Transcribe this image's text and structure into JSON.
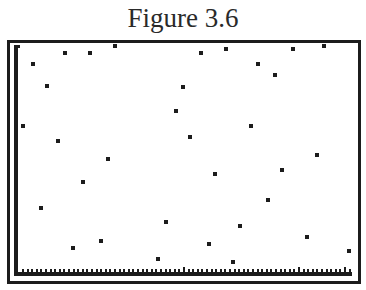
{
  "title": "Figure 3.6",
  "chart_data": {
    "type": "scatter",
    "title": "Figure 3.6",
    "xlabel": "",
    "ylabel": "",
    "grid": false,
    "legend": null,
    "x_axis_ticks": "many evenly spaced tick marks along bottom axis, unlabeled",
    "note": "Calculator-style scatter plot; pixel coordinates of points (x right, y down)",
    "points_px": [
      [
        33,
        64
      ],
      [
        47,
        86
      ],
      [
        65,
        53
      ],
      [
        90,
        53
      ],
      [
        115,
        46
      ],
      [
        201,
        53
      ],
      [
        226,
        49
      ],
      [
        258,
        64
      ],
      [
        275,
        75
      ],
      [
        293,
        49
      ],
      [
        324,
        46
      ],
      [
        183,
        87
      ],
      [
        176,
        111
      ],
      [
        23,
        126
      ],
      [
        58,
        141
      ],
      [
        108,
        159
      ],
      [
        83,
        182
      ],
      [
        41,
        208
      ],
      [
        190,
        137
      ],
      [
        251,
        126
      ],
      [
        317,
        155
      ],
      [
        282,
        170
      ],
      [
        215,
        174
      ],
      [
        268,
        200
      ],
      [
        73,
        248
      ],
      [
        101,
        241
      ],
      [
        166,
        222
      ],
      [
        158,
        259
      ],
      [
        209,
        244
      ],
      [
        240,
        226
      ],
      [
        233,
        262
      ],
      [
        307,
        237
      ],
      [
        349,
        251
      ]
    ],
    "axis": {
      "origin_px": [
        16,
        272
      ],
      "y_top_px": 45,
      "x_right_px": 352
    },
    "colors": {
      "points": "#1c1c1c",
      "axes": "#1c1c1c",
      "background": "#ffffff"
    }
  }
}
